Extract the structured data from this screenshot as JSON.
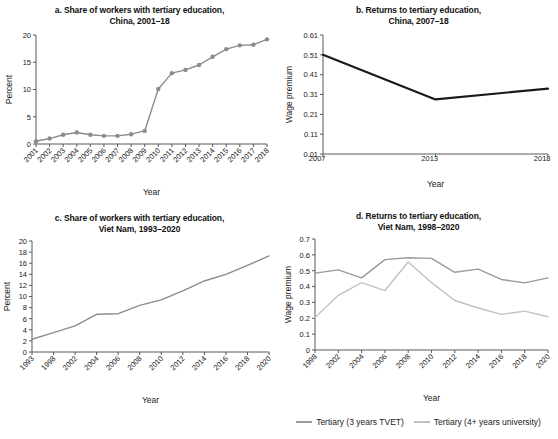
{
  "figure": {
    "background": "#ffffff",
    "legend": {
      "items": [
        {
          "label": "Tertiary (3 years TVET)",
          "color": "#9a9a9a"
        },
        {
          "label": "Tertiary (4+ years university)",
          "color": "#c2c2c2"
        }
      ]
    }
  },
  "chart_data": [
    {
      "id": "a",
      "type": "line",
      "title": "a. Share of workers with tertiary education,",
      "title_line2": "China, 2001–18",
      "xlabel": "Year",
      "ylabel": "Percent",
      "series_color": "#8c8c8c",
      "markers": true,
      "grid": false,
      "xlim": [
        2001,
        2018
      ],
      "ylim": [
        0,
        20
      ],
      "yticks": [
        0,
        5,
        10,
        15,
        20
      ],
      "x": [
        2001,
        2002,
        2003,
        2004,
        2005,
        2006,
        2007,
        2008,
        2009,
        2010,
        2011,
        2012,
        2013,
        2014,
        2015,
        2016,
        2017,
        2018
      ],
      "xtick_labels": [
        "2001",
        "2002",
        "2003",
        "2004",
        "2005",
        "2006",
        "2007",
        "2008",
        "2009",
        "2010",
        "2011",
        "2012",
        "2013",
        "2014",
        "2015",
        "2016",
        "2017",
        "2018"
      ],
      "values": [
        0.5,
        1.0,
        1.7,
        2.1,
        1.7,
        1.5,
        1.5,
        1.8,
        2.4,
        10.1,
        13.0,
        13.6,
        14.5,
        16.0,
        17.4,
        18.1,
        18.2,
        19.2
      ]
    },
    {
      "id": "b",
      "type": "line",
      "title": "b. Returns to tertiary education,",
      "title_line2": "China, 2007–18",
      "xlabel": "Year",
      "ylabel": "Wage premium",
      "series_color": "#1a1a1a",
      "markers": false,
      "grid": false,
      "xlim": [
        2007,
        2018
      ],
      "ylim": [
        0.01,
        0.61
      ],
      "yticks": [
        0.01,
        0.11,
        0.21,
        0.31,
        0.41,
        0.51,
        0.61
      ],
      "ytick_labels": [
        "0.01",
        "0.11",
        "0.21",
        "0.31",
        "0.41",
        "0.51",
        "0.61"
      ],
      "x": [
        2007,
        2013,
        2018
      ],
      "xtick_labels": [
        "2007",
        "2013",
        "2018"
      ],
      "values": [
        0.51,
        0.285,
        0.34
      ]
    },
    {
      "id": "c",
      "type": "line",
      "title": "c. Share of workers with tertiary education,",
      "title_line2": "Viet Nam, 1993–2020",
      "xlabel": "Year",
      "ylabel": "Percent",
      "series_color": "#8c8c8c",
      "markers": false,
      "grid": false,
      "xlim": [
        1993,
        2020
      ],
      "ylim": [
        0,
        20
      ],
      "yticks": [
        0,
        2,
        4,
        6,
        8,
        10,
        12,
        14,
        16,
        18,
        20
      ],
      "x": [
        1993,
        1998,
        2002,
        2004,
        2006,
        2008,
        2010,
        2012,
        2014,
        2016,
        2018,
        2020
      ],
      "xtick_labels": [
        "1993",
        "1998",
        "2002",
        "2004",
        "2006",
        "2008",
        "2010",
        "2012",
        "2014",
        "2016",
        "2018",
        "2020"
      ],
      "values": [
        2.3,
        3.5,
        4.7,
        6.8,
        6.9,
        8.4,
        9.4,
        11.0,
        12.8,
        14.0,
        15.6,
        17.3
      ]
    },
    {
      "id": "d",
      "type": "line",
      "title": "d. Returns to tertiary education,",
      "title_line2": "Viet Nam, 1998–2020",
      "xlabel": "Year",
      "ylabel": "Wage premium",
      "grid": false,
      "markers": false,
      "xlim": [
        1998,
        2020
      ],
      "ylim": [
        0,
        0.7
      ],
      "yticks": [
        0,
        0.1,
        0.2,
        0.3,
        0.4,
        0.5,
        0.6,
        0.7
      ],
      "ytick_labels": [
        "0",
        "0.1",
        "0.2",
        "0.3",
        "0.4",
        "0.5",
        "0.6",
        "0.7"
      ],
      "x": [
        1998,
        2002,
        2004,
        2006,
        2008,
        2010,
        2012,
        2014,
        2016,
        2018,
        2020
      ],
      "xtick_labels": [
        "1998",
        "2002",
        "2004",
        "2006",
        "2008",
        "2010",
        "2012",
        "2014",
        "2016",
        "2018",
        "2020"
      ],
      "series": [
        {
          "name": "Tertiary (3 years TVET)",
          "color": "#9a9a9a",
          "values": [
            0.485,
            0.505,
            0.455,
            0.57,
            0.582,
            0.578,
            0.49,
            0.51,
            0.445,
            0.423,
            0.455
          ]
        },
        {
          "name": "Tertiary (4+ years university)",
          "color": "#c2c2c2",
          "values": [
            0.205,
            0.345,
            0.425,
            0.375,
            0.555,
            0.425,
            0.312,
            0.265,
            0.225,
            0.245,
            0.21
          ]
        }
      ]
    }
  ]
}
